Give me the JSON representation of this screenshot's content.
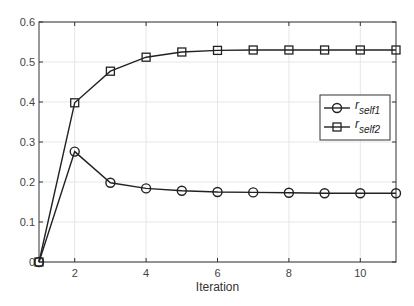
{
  "chart_data": {
    "type": "line",
    "title": "",
    "xlabel": "Iteration",
    "ylabel": "",
    "x": [
      1,
      2,
      3,
      4,
      5,
      6,
      7,
      8,
      9,
      10,
      11
    ],
    "xlim": [
      1,
      11
    ],
    "ylim": [
      0,
      0.6
    ],
    "xticks": [
      2,
      4,
      6,
      8,
      10
    ],
    "yticks": [
      0,
      0.1,
      0.2,
      0.3,
      0.4,
      0.5,
      0.6
    ],
    "ytick_labels": [
      "0",
      "0.1",
      "0.2",
      "0.3",
      "0.4",
      "0.5",
      "0.6"
    ],
    "grid": true,
    "legend_position": "right-center",
    "series": [
      {
        "name": "r_self1",
        "label_main": "r",
        "label_sub": "self1",
        "marker": "circle",
        "values": [
          0,
          0.276,
          0.198,
          0.184,
          0.178,
          0.175,
          0.174,
          0.173,
          0.172,
          0.172,
          0.172
        ]
      },
      {
        "name": "r_self2",
        "label_main": "r",
        "label_sub": "self2",
        "marker": "square",
        "values": [
          0,
          0.398,
          0.477,
          0.512,
          0.525,
          0.529,
          0.53,
          0.53,
          0.53,
          0.53,
          0.53
        ]
      }
    ],
    "colors": {
      "line": "#222222",
      "grid": "#e6e6e6",
      "axis": "#333333"
    }
  }
}
